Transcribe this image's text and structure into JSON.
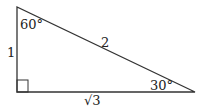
{
  "diagram": {
    "type": "right-triangle",
    "labels": {
      "angle_top": "60°",
      "angle_right": "30°",
      "hypotenuse": "2",
      "left_side": "1",
      "bottom_side": "√3"
    },
    "stroke_color": "#333333"
  }
}
